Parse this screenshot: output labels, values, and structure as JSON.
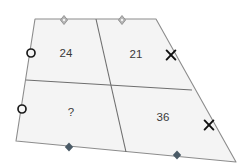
{
  "figure": {
    "type": "geometry-diagram",
    "shape_name": "quadrilateral",
    "fill_color": "#f4f4f4",
    "outline_color": "#8c8c8c",
    "inner_line_color": "#6e6e6e",
    "label_color": "#3a3a3a",
    "marker_open_color": "#222222",
    "marker_solid_color": "#4a5a66",
    "marker_gray_color": "#9a9a9a",
    "marker_x_color": "#111111",
    "vertices": {
      "top_left": {
        "x": 35,
        "y": 19
      },
      "top_right": {
        "x": 156,
        "y": 19
      },
      "bottom_right": {
        "x": 236,
        "y": 162
      },
      "bottom_left": {
        "x": 16,
        "y": 141
      }
    },
    "inner_segments": [
      {
        "name": "vertical-transversal",
        "from": {
          "x": 96,
          "y": 19
        },
        "to": {
          "x": 126,
          "y": 152
        }
      },
      {
        "name": "horizontal-transversal",
        "from": {
          "x": 26,
          "y": 80
        },
        "to": {
          "x": 192,
          "y": 90
        }
      }
    ],
    "regions": [
      {
        "name": "top-left-region",
        "label": "24",
        "x": 66,
        "y": 54
      },
      {
        "name": "top-right-region",
        "label": "21",
        "x": 136,
        "y": 55
      },
      {
        "name": "bottom-left-region",
        "label": "?",
        "x": 71,
        "y": 113
      },
      {
        "name": "bottom-right-region",
        "label": "36",
        "x": 163,
        "y": 118
      }
    ],
    "edge_markers": [
      {
        "name": "top-edge-marker-left",
        "glyph": "diamond-gray",
        "x": 64,
        "y": 20
      },
      {
        "name": "top-edge-marker-right",
        "glyph": "diamond-gray",
        "x": 122,
        "y": 20
      },
      {
        "name": "left-edge-marker-upper",
        "glyph": "circle-open",
        "x": 31,
        "y": 53
      },
      {
        "name": "left-edge-marker-lower",
        "glyph": "circle-open",
        "x": 22,
        "y": 109
      },
      {
        "name": "right-edge-marker-upper",
        "glyph": "x-mark",
        "x": 171,
        "y": 55
      },
      {
        "name": "right-edge-marker-lower",
        "glyph": "x-mark",
        "x": 209,
        "y": 125
      },
      {
        "name": "bottom-edge-marker-left",
        "glyph": "diamond-solid",
        "x": 69,
        "y": 147
      },
      {
        "name": "bottom-edge-marker-right",
        "glyph": "diamond-solid",
        "x": 177,
        "y": 155
      }
    ]
  }
}
